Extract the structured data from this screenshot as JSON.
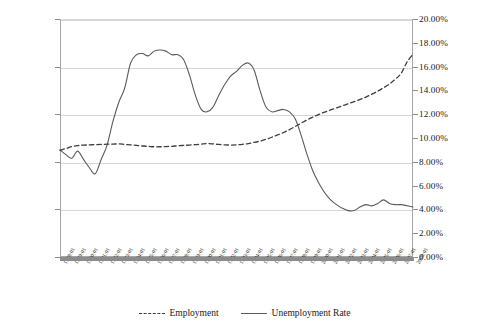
{
  "chart_data": {
    "type": "line",
    "title": "",
    "xlabel": "",
    "ylabel": "",
    "grid": true,
    "legend_position": "bottom",
    "axes": {
      "left": {
        "label": "Employment",
        "ylim": [
          0,
          2500000
        ],
        "ticks": [
          0,
          500000,
          1000000,
          1500000,
          2000000,
          2500000
        ],
        "tick_labels": [
          "",
          "500,000",
          "1,000,000",
          "1,500,000",
          "2,000,000",
          "2,500,000"
        ]
      },
      "right": {
        "label": "Unemployment Rate",
        "ylim": [
          0,
          20
        ],
        "ticks": [
          0,
          2,
          4,
          6,
          8,
          10,
          12,
          14,
          16,
          18,
          20
        ],
        "tick_labels": [
          "0.00%",
          "2.00%",
          "4.00%",
          "6.00%",
          "8.00%",
          "10.00%",
          "12.00%",
          "14.00%",
          "16.00%",
          "18.00%",
          "20.00%"
        ]
      },
      "x": {
        "start": "1978:01",
        "end": "2008:01",
        "frequency": "monthly",
        "tick_labels": [
          "1978:01",
          "1979:01",
          "1980:01",
          "1981:01",
          "1982:01",
          "1983:01",
          "1984:01",
          "1985:01",
          "1986:01",
          "1987:01",
          "1988:01",
          "1989:01",
          "1990:01",
          "1991:01",
          "1992:01",
          "1993:01",
          "1994:01",
          "1995:01",
          "1996:01",
          "1997:01",
          "1998:01",
          "1999:01",
          "2000:01",
          "2001:01",
          "2002:01",
          "2003:01",
          "2004:01",
          "2005:01",
          "2006:01",
          "2007:01",
          "2008:01"
        ]
      }
    },
    "series": [
      {
        "name": "Employment",
        "axis": "left",
        "style": "dashed",
        "color": "#3d3d3d",
        "x": [
          "1978:01",
          "1978:07",
          "1979:01",
          "1979:07",
          "1980:01",
          "1980:07",
          "1981:01",
          "1981:07",
          "1982:01",
          "1982:07",
          "1983:01",
          "1983:07",
          "1984:01",
          "1984:07",
          "1985:01",
          "1985:07",
          "1986:01",
          "1986:07",
          "1987:01",
          "1987:07",
          "1988:01",
          "1988:07",
          "1989:01",
          "1989:07",
          "1990:01",
          "1990:07",
          "1991:01",
          "1991:07",
          "1992:01",
          "1992:07",
          "1993:01",
          "1993:07",
          "1994:01",
          "1994:07",
          "1995:01",
          "1995:07",
          "1996:01",
          "1996:07",
          "1997:01",
          "1997:07",
          "1998:01",
          "1998:07",
          "1999:01",
          "1999:07",
          "2000:01",
          "2000:07",
          "2001:01",
          "2001:07",
          "2002:01",
          "2002:07",
          "2003:01",
          "2003:07",
          "2004:01",
          "2004:07",
          "2005:01",
          "2005:07",
          "2006:01",
          "2006:07",
          "2007:01",
          "2007:07",
          "2008:01"
        ],
        "values": [
          1120000,
          1140000,
          1160000,
          1170000,
          1175000,
          1178000,
          1180000,
          1182000,
          1185000,
          1186000,
          1188000,
          1183000,
          1178000,
          1172000,
          1166000,
          1162000,
          1158000,
          1158000,
          1160000,
          1163000,
          1168000,
          1172000,
          1176000,
          1180000,
          1186000,
          1192000,
          1188000,
          1182000,
          1178000,
          1176000,
          1178000,
          1184000,
          1192000,
          1204000,
          1218000,
          1236000,
          1258000,
          1282000,
          1308000,
          1338000,
          1372000,
          1406000,
          1440000,
          1470000,
          1498000,
          1522000,
          1545000,
          1566000,
          1588000,
          1610000,
          1632000,
          1655000,
          1680000,
          1710000,
          1742000,
          1778000,
          1818000,
          1868000,
          1930000,
          2050000,
          2130000
        ]
      },
      {
        "name": "Unemployment Rate",
        "axis": "right",
        "style": "solid",
        "color": "#5a5a5a",
        "x": [
          "1978:01",
          "1978:07",
          "1979:01",
          "1979:07",
          "1980:01",
          "1980:07",
          "1981:01",
          "1981:07",
          "1982:01",
          "1982:07",
          "1983:01",
          "1983:07",
          "1984:01",
          "1984:07",
          "1985:01",
          "1985:07",
          "1986:01",
          "1986:07",
          "1987:01",
          "1987:07",
          "1988:01",
          "1988:07",
          "1989:01",
          "1989:07",
          "1990:01",
          "1990:07",
          "1991:01",
          "1991:07",
          "1992:01",
          "1992:07",
          "1993:01",
          "1993:07",
          "1994:01",
          "1994:07",
          "1995:01",
          "1995:07",
          "1996:01",
          "1996:07",
          "1997:01",
          "1997:07",
          "1998:01",
          "1998:07",
          "1999:01",
          "1999:07",
          "2000:01",
          "2000:07",
          "2001:01",
          "2001:07",
          "2002:01",
          "2002:07",
          "2003:01",
          "2003:07",
          "2004:01",
          "2004:07",
          "2005:01",
          "2005:07",
          "2006:01",
          "2006:07",
          "2007:01",
          "2007:07",
          "2008:01"
        ],
        "values": [
          9.0,
          8.6,
          8.3,
          8.9,
          8.2,
          7.5,
          7.0,
          8.2,
          9.4,
          11.4,
          13.0,
          14.2,
          16.3,
          17.0,
          17.1,
          16.9,
          17.3,
          17.4,
          17.3,
          17.0,
          17.0,
          16.6,
          15.3,
          13.6,
          12.4,
          12.2,
          12.6,
          13.6,
          14.5,
          15.2,
          15.6,
          16.1,
          16.3,
          15.7,
          14.0,
          12.6,
          12.2,
          12.3,
          12.4,
          12.2,
          11.6,
          10.2,
          8.6,
          7.2,
          6.2,
          5.4,
          4.8,
          4.4,
          4.1,
          3.9,
          3.9,
          4.2,
          4.4,
          4.3,
          4.5,
          4.8,
          4.5,
          4.4,
          4.4,
          4.3,
          4.2
        ]
      }
    ]
  },
  "legend": {
    "items": [
      {
        "label": "Employment",
        "style": "dashed"
      },
      {
        "label": "Unemployment Rate",
        "style": "solid"
      }
    ]
  }
}
